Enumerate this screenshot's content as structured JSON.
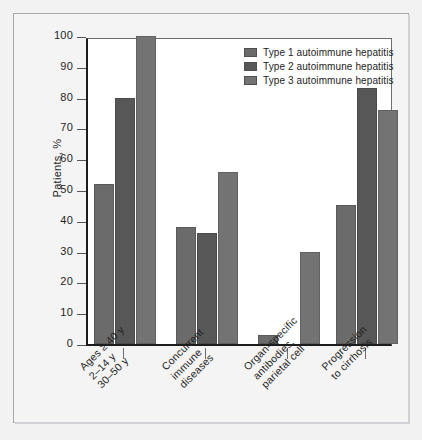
{
  "chart_data": {
    "type": "bar",
    "title": "",
    "xlabel": "",
    "ylabel": "Patients, %",
    "ylim": [
      0,
      100
    ],
    "yticks": [
      0,
      10,
      20,
      30,
      40,
      50,
      60,
      70,
      80,
      90,
      100
    ],
    "ytick_labels": [
      "0",
      "10",
      "20",
      "30",
      "40",
      "50",
      "60",
      "70",
      "80",
      "90",
      "100"
    ],
    "grid": false,
    "legend_position": "top-right",
    "categories": [
      "Ages ≥ 40 y\n2–14 y\n30–50 y",
      "Concurrent\nimmune\ndiseases",
      "Organ-specific\nantibodies,\nparietal cell",
      "Progression\nto cirrhosis"
    ],
    "category_lines": [
      [
        "Ages ≥ 40 y",
        "2–14 y",
        "30–50 y"
      ],
      [
        "Concurrent",
        "immune",
        "diseases"
      ],
      [
        "Organ-specific",
        "antibodies,",
        "parietal cell"
      ],
      [
        "Progression",
        "to cirrhosis"
      ]
    ],
    "series": [
      {
        "name": "Type 1 autoimmune hepatitis",
        "color": "#6b6b6b",
        "values": [
          52,
          38,
          3,
          45
        ]
      },
      {
        "name": "Type 2 autoimmune hepatitis",
        "color": "#575757",
        "values": [
          80,
          36,
          0,
          83
        ]
      },
      {
        "name": "Type 3 autoimmune hepatitis",
        "color": "#737373",
        "values": [
          100,
          56,
          30,
          76
        ]
      }
    ]
  },
  "legend": {
    "entries": [
      {
        "label": "Type 1 autoimmune hepatitis",
        "color": "#6b6b6b"
      },
      {
        "label": "Type 2 autoimmune hepatitis",
        "color": "#575757"
      },
      {
        "label": "Type 3 autoimmune hepatitis",
        "color": "#737373"
      }
    ]
  }
}
